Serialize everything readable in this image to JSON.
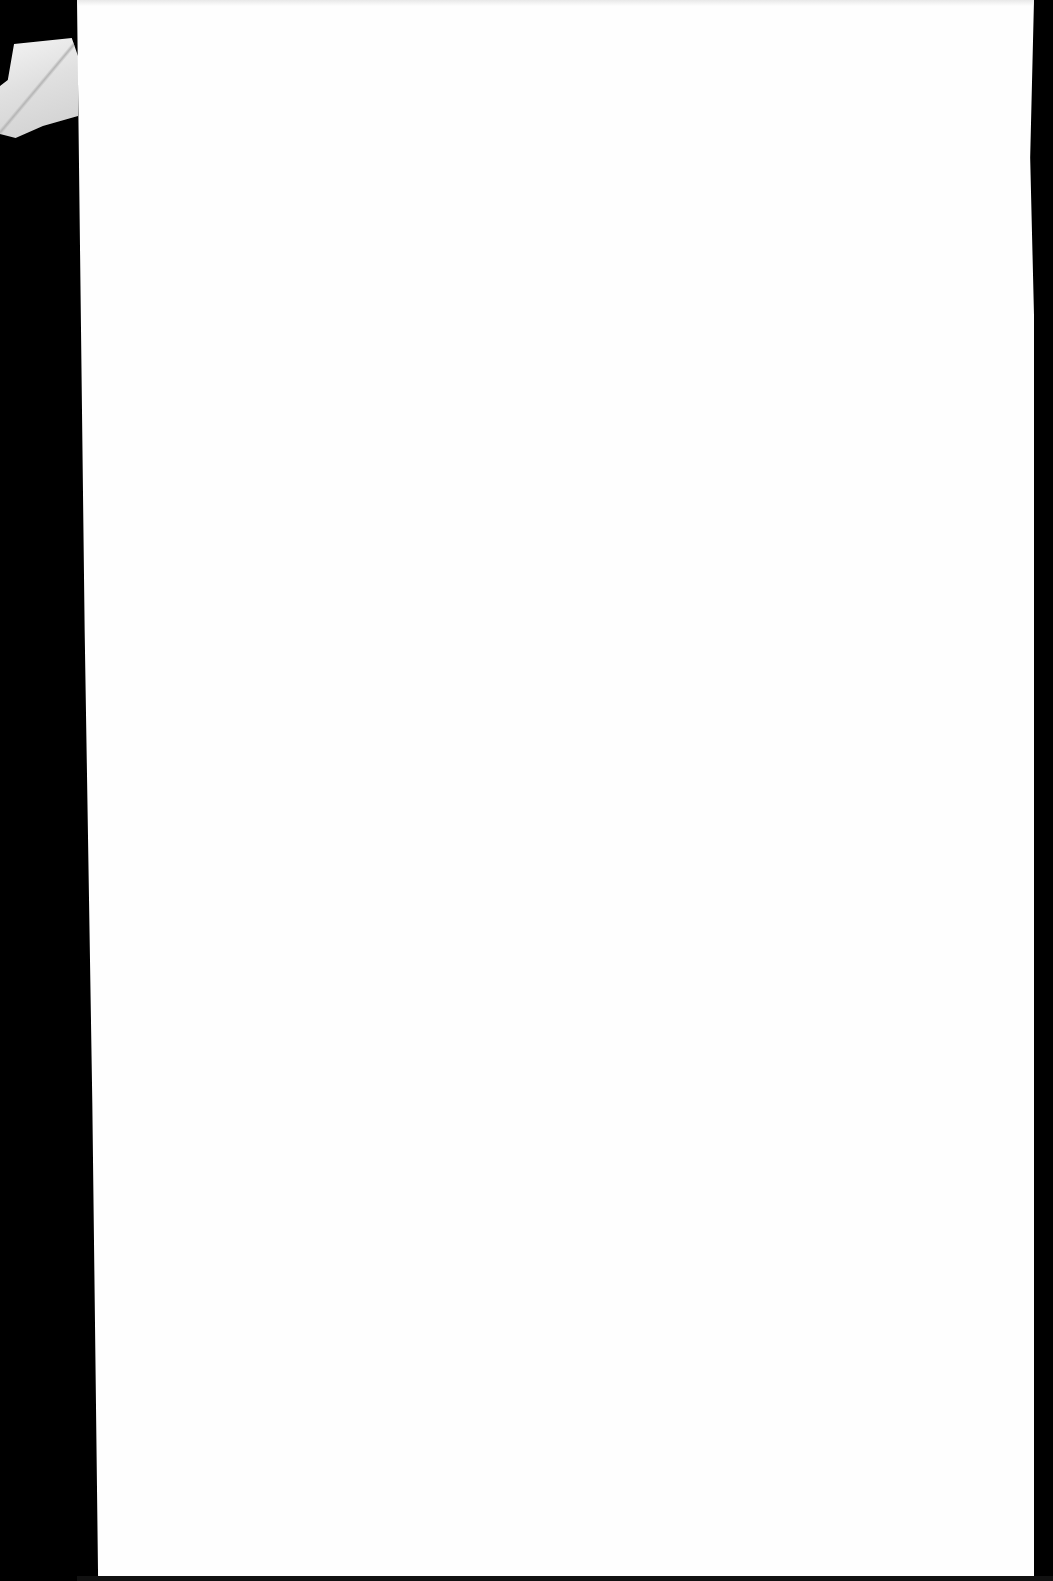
{
  "document": {
    "type": "scanned-page",
    "content": "",
    "page_color": "#fefefe",
    "background_color": "#000000"
  }
}
